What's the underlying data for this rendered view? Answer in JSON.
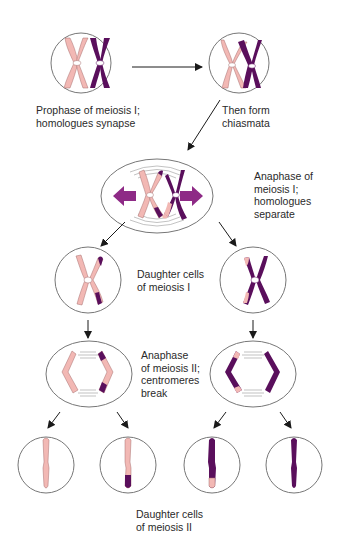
{
  "diagram": {
    "colors": {
      "maternal": "#f2b8b4",
      "paternal": "#5a0f5c",
      "arrow_spindle": "#8e2a86",
      "cell_outline": "#777777",
      "text": "#2a2a2a"
    },
    "stages": [
      {
        "id": "prophase-i",
        "label": "Prophase of meiosis I;\nhomologues synapse"
      },
      {
        "id": "chiasmata",
        "label": "Then form\nchiasmata"
      },
      {
        "id": "anaphase-i",
        "label": "Anaphase of\nmeiosis I;\nhomologues\nseparate"
      },
      {
        "id": "daughter-i",
        "label": "Daughter cells\nof meiosis I"
      },
      {
        "id": "anaphase-ii",
        "label": "Anaphase\nof meiosis II;\ncentromeres\nbreak"
      },
      {
        "id": "daughter-ii",
        "label": "Daughter cells\nof meiosis II"
      }
    ]
  }
}
